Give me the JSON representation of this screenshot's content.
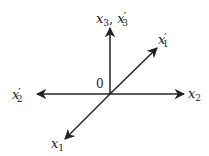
{
  "diagram": {
    "type": "coordinate-axes",
    "origin_label": "0",
    "stroke_color": "#222222",
    "origin": [
      110,
      94
    ],
    "axes": [
      {
        "id": "x3",
        "direction": "up",
        "tip": [
          110,
          27
        ]
      },
      {
        "id": "x2",
        "direction": "right",
        "tip": [
          185,
          94
        ]
      },
      {
        "id": "x2prime",
        "direction": "left",
        "tip": [
          36,
          94
        ]
      },
      {
        "id": "x1prime",
        "direction": "up-right",
        "tip": [
          158,
          47
        ]
      },
      {
        "id": "x1",
        "direction": "down-left",
        "tip": [
          64,
          140
        ]
      }
    ],
    "labels": {
      "x3": {
        "base": "x",
        "sub": "3",
        "prime": ""
      },
      "sep": ", ",
      "x3prime": {
        "base": "x",
        "sub": "3",
        "prime": "′"
      },
      "x1prime": {
        "base": "x",
        "sub": "1",
        "prime": "′"
      },
      "x2prime": {
        "base": "x",
        "sub": "2",
        "prime": "′"
      },
      "x2": {
        "base": "x",
        "sub": "2",
        "prime": ""
      },
      "x1": {
        "base": "x",
        "sub": "1",
        "prime": ""
      }
    }
  }
}
